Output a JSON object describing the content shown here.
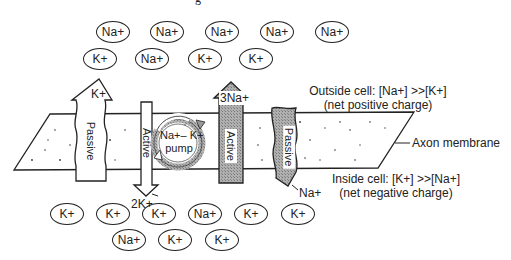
{
  "caption_partial": "g",
  "outside_ions": [
    {
      "label": "Na+",
      "x": 96,
      "y": 21
    },
    {
      "label": "Na+",
      "x": 150,
      "y": 21
    },
    {
      "label": "Na+",
      "x": 205,
      "y": 21
    },
    {
      "label": "Na+",
      "x": 260,
      "y": 21
    },
    {
      "label": "Na+",
      "x": 315,
      "y": 21
    },
    {
      "label": "K+",
      "x": 83,
      "y": 48
    },
    {
      "label": "Na+",
      "x": 135,
      "y": 48
    },
    {
      "label": "K+",
      "x": 188,
      "y": 48
    },
    {
      "label": "K+",
      "x": 239,
      "y": 48
    }
  ],
  "inside_ions": [
    {
      "label": "K+",
      "x": 50,
      "y": 203
    },
    {
      "label": "K+",
      "x": 96,
      "y": 203
    },
    {
      "label": "K+",
      "x": 142,
      "y": 203
    },
    {
      "label": "Na+",
      "x": 188,
      "y": 203
    },
    {
      "label": "K+",
      "x": 234,
      "y": 203
    },
    {
      "label": "K+",
      "x": 281,
      "y": 203
    },
    {
      "label": "Na+",
      "x": 112,
      "y": 229
    },
    {
      "label": "K+",
      "x": 158,
      "y": 229
    },
    {
      "label": "K+",
      "x": 205,
      "y": 229
    }
  ],
  "arrows": {
    "passive_k": {
      "ion": "K+",
      "mode": "Passive",
      "direction": "outward"
    },
    "active_k": {
      "ion": "2K+",
      "mode": "Active",
      "direction": "inward"
    },
    "active_na": {
      "ion": "3Na+",
      "mode": "Active",
      "direction": "outward"
    },
    "passive_na": {
      "ion": "Na+",
      "mode": "Passive",
      "direction": "inward"
    }
  },
  "pump": {
    "line1": "Na+– K+",
    "line2": "pump"
  },
  "labels": {
    "outside_line1": "Outside cell: [Na+] >>[K+]",
    "outside_line2": "(net positive charge)",
    "membrane": "Axon membrane",
    "inside_line1": "Inside cell: [K+] >>[Na+]",
    "inside_line2": "(net negative charge)"
  },
  "colors": {
    "stroke": "#222222",
    "shaded": "#a8a8a8",
    "background": "#ffffff"
  }
}
